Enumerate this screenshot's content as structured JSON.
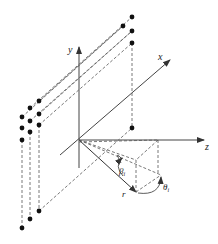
{
  "diagram": {
    "type": "3d-coordinate-geometry",
    "axes": {
      "x": {
        "label": "x"
      },
      "y": {
        "label": "y"
      },
      "z": {
        "label": "z"
      }
    },
    "annotations": {
      "radius": "r",
      "elevation_angle": "β",
      "elevation_sub": "i",
      "azimuth_angle": "θ",
      "azimuth_sub": "i"
    },
    "array_points": {
      "left_grid": 9,
      "top_column": 4,
      "bottom_row": 3,
      "center_point": 1
    },
    "colors": {
      "line": "#333333",
      "dot": "#111111",
      "background": "#ffffff"
    }
  }
}
